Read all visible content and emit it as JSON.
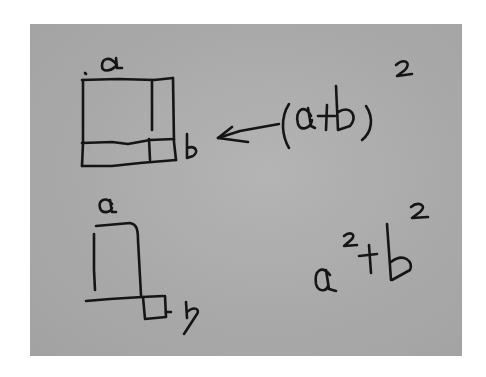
{
  "image": {
    "description": "Handwritten sketch on gray paper comparing (a+b)^2 with a^2+b^2",
    "paper_color": "#aaaaaa",
    "ink_color": "#151515",
    "background_color": "#ffffff"
  },
  "top_diagram": {
    "label_top": "a",
    "label_side": "b",
    "description": "Square split into a large a-by-a square, two a-by-b rectangles, and a small b-by-b square"
  },
  "top_expression": {
    "text": "(a+b)",
    "exponent": "2",
    "full": "(a+b)²",
    "arrow": "left-arrow"
  },
  "bottom_diagram": {
    "label_top": "a",
    "label_side": "b",
    "description": "Separate a-square and small b-square sharing a baseline"
  },
  "bottom_expression": {
    "base_a": "a",
    "exp_a": "2",
    "plus": "+",
    "base_b": "b",
    "exp_b": "2",
    "full": "a²+b²"
  }
}
